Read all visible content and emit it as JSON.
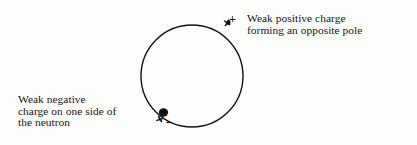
{
  "figure": {
    "background_color": "#fdfdfc",
    "ink_color": "#111111"
  },
  "neutron": {
    "label": "neutron",
    "shape": "circle",
    "center_x": 192,
    "center_y": 76,
    "radius": 51,
    "stroke_width": 1.4,
    "stroke_color": "#111111",
    "fill": "none"
  },
  "markers": [
    {
      "id": "positive-charge-marker",
      "sign": "+",
      "polarity": "positive",
      "x": 230,
      "y": 29,
      "blob_radius": 2.6,
      "color": "#111111"
    },
    {
      "id": "negative-charge-marker",
      "sign": "-",
      "polarity": "negative",
      "x": 163,
      "y": 113,
      "blob_radius": 4.2,
      "color": "#111111"
    }
  ],
  "captions": {
    "positive": {
      "line1": "Weak positive charge",
      "line2": "forming an opposite pole"
    },
    "negative": {
      "line1": "Weak negative",
      "line2": "charge on one side of",
      "line3": "the neutron"
    }
  },
  "signs": {
    "positive": "+",
    "negative": "-"
  }
}
